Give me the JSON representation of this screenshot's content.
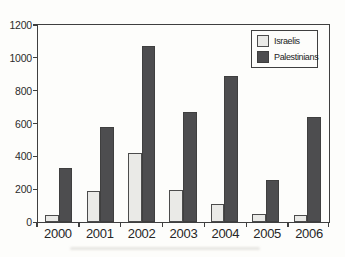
{
  "chart_data": {
    "type": "bar",
    "title": "",
    "xlabel": "",
    "ylabel": "",
    "categories": [
      "2000",
      "2001",
      "2002",
      "2003",
      "2004",
      "2005",
      "2006"
    ],
    "series": [
      {
        "name": "Israelis",
        "color": "#eaeae7",
        "border_color": "#4c4c4c",
        "values": [
          45,
          190,
          425,
          195,
          110,
          50,
          40
        ]
      },
      {
        "name": "Palestinians",
        "color": "#4d4d4f",
        "border_color": "#3f3f3f",
        "values": [
          330,
          580,
          1080,
          675,
          895,
          260,
          640
        ]
      }
    ],
    "ylim": [
      0,
      1200
    ],
    "yticks": [
      0,
      200,
      400,
      600,
      800,
      1000,
      1200
    ],
    "grid": false,
    "legend": {
      "position": "top-right",
      "entries": [
        "Israelis",
        "Palestinians"
      ]
    }
  },
  "colors": {
    "background": "#fdfdfb",
    "axis": "#3f3f3f",
    "text": "#2b2b2b"
  }
}
